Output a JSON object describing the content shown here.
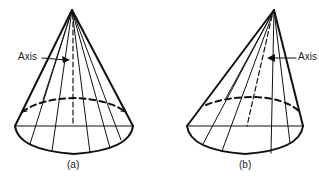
{
  "figure": {
    "panels": [
      {
        "id": "a",
        "caption": "(a)",
        "axis_label": "Axis",
        "description": "Right circular cone: apex directly above base center"
      },
      {
        "id": "b",
        "caption": "(b)",
        "axis_label": "Axis",
        "description": "Oblique cone: apex offset from base center"
      }
    ],
    "colors": {
      "stroke": "#111111",
      "background": "#ffffff"
    }
  }
}
